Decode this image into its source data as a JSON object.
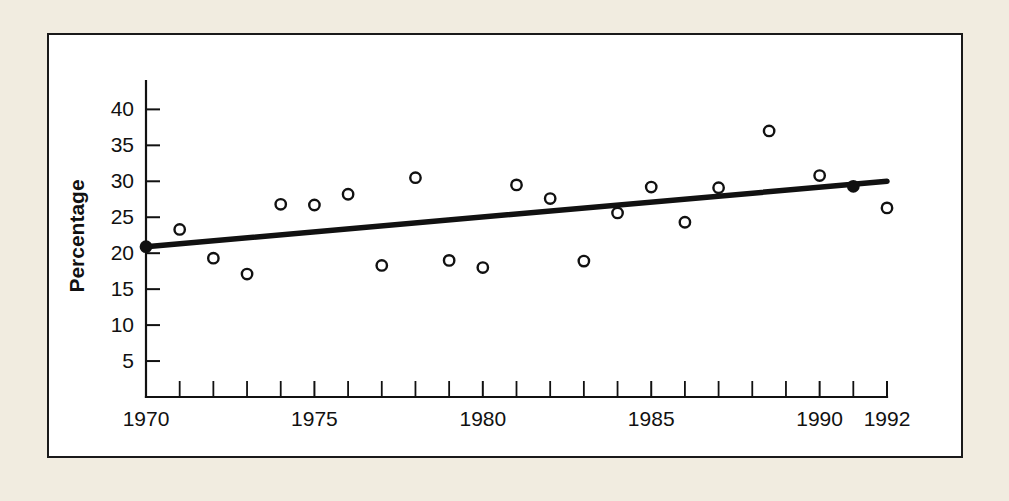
{
  "figure": {
    "background_color": "#f1ece0",
    "panel_color": "#ffffff",
    "ink_color": "#111111"
  },
  "chart_data": {
    "type": "scatter",
    "title": "",
    "xlabel": "",
    "ylabel": "Percentage",
    "xlim": [
      1970,
      1992
    ],
    "ylim": [
      0,
      42
    ],
    "grid": false,
    "legend": null,
    "x_tick_labels": [
      "1970",
      "1975",
      "1980",
      "1985",
      "1990",
      "1992"
    ],
    "x_tick_label_values": [
      1970,
      1975,
      1980,
      1985,
      1990,
      1992
    ],
    "x_minor_ticks": [
      1971,
      1972,
      1973,
      1974,
      1976,
      1977,
      1978,
      1979,
      1981,
      1982,
      1983,
      1984,
      1986,
      1987,
      1988,
      1989,
      1991
    ],
    "y_tick_labels": [
      "5",
      "10",
      "15",
      "20",
      "25",
      "30",
      "35",
      "40"
    ],
    "y_tick_values": [
      5,
      10,
      15,
      20,
      25,
      30,
      35,
      40
    ],
    "series": [
      {
        "name": "Percentage",
        "marker": "open-circle",
        "x": [
          1971,
          1972,
          1973,
          1974,
          1975,
          1976,
          1977,
          1978,
          1979,
          1980,
          1981,
          1982,
          1983,
          1984,
          1985,
          1986,
          1987,
          1988.5,
          1990,
          1992
        ],
        "values": [
          23.3,
          19.3,
          17.1,
          26.8,
          26.7,
          28.2,
          18.3,
          30.5,
          19.0,
          18.0,
          29.5,
          27.6,
          18.9,
          25.6,
          29.2,
          24.3,
          29.1,
          37.0,
          30.8,
          26.3
        ]
      },
      {
        "name": "Trend line endpoints",
        "marker": "filled-circle",
        "x": [
          1970,
          1991
        ],
        "values": [
          20.9,
          29.3
        ]
      }
    ],
    "trend_line": {
      "x": [
        1970,
        1992
      ],
      "values": [
        20.9,
        30.0
      ]
    }
  }
}
